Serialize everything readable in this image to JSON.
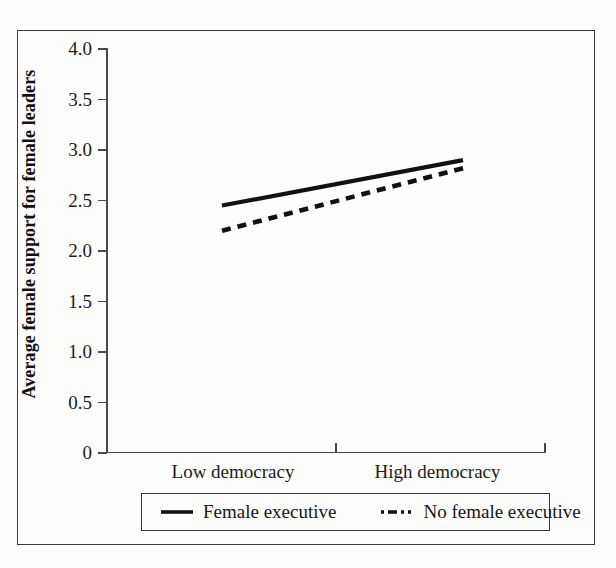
{
  "chart_data": {
    "type": "line",
    "title": "",
    "xlabel": "",
    "ylabel": "Average female support for female leaders",
    "categories": [
      "Low democracy",
      "High democracy"
    ],
    "x": [
      0,
      1
    ],
    "xlim": [
      -0.35,
      1.4
    ],
    "ylim": [
      0,
      4.0
    ],
    "yticks": [
      0,
      0.5,
      1.0,
      1.5,
      2.0,
      2.5,
      3.0,
      3.5,
      4.0
    ],
    "ytick_labels": [
      "0",
      "0.5",
      "1.0",
      "1.5",
      "2.0",
      "2.5",
      "3.0",
      "3.5",
      "4.0"
    ],
    "grid": false,
    "legend_position": "bottom",
    "series": [
      {
        "name": "Female executive",
        "style": "solid",
        "color": "#111111",
        "values": [
          2.44,
          2.89
        ]
      },
      {
        "name": "No female executive",
        "style": "dashed",
        "color": "#111111",
        "values": [
          2.19,
          2.81
        ]
      }
    ]
  },
  "axis": {
    "y_title": "Average female support for female leaders",
    "ytick_labels": [
      "4.0",
      "3.5",
      "3.0",
      "2.5",
      "2.0",
      "1.5",
      "1.0",
      "0.5",
      "0"
    ],
    "xtick_labels": {
      "low": "Low democracy",
      "high": "High democracy"
    }
  },
  "legend": {
    "items": [
      {
        "label": "Female executive",
        "style": "solid"
      },
      {
        "label": "No female executive",
        "style": "dashed"
      }
    ]
  },
  "colors": {
    "ink": "#111111",
    "axis": "#4a4a4a",
    "frame": "#3a3a3a",
    "paper": "#fdfdfc"
  }
}
